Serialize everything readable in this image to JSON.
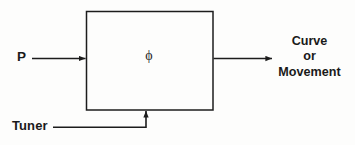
{
  "diagram": {
    "background_color": "#fdfdfc",
    "stroke_color": "#1c1c1c",
    "block": {
      "symbol": "ϕ",
      "symbol_name": "phi",
      "x": 86,
      "y": 11,
      "width": 127,
      "height": 99
    },
    "input": {
      "label": "P",
      "arrow_direction": "right"
    },
    "control": {
      "label": "Tuner",
      "arrow_direction": "up"
    },
    "output": {
      "arrow_direction": "right",
      "lines": [
        "Curve",
        "or",
        "Movement"
      ]
    }
  }
}
